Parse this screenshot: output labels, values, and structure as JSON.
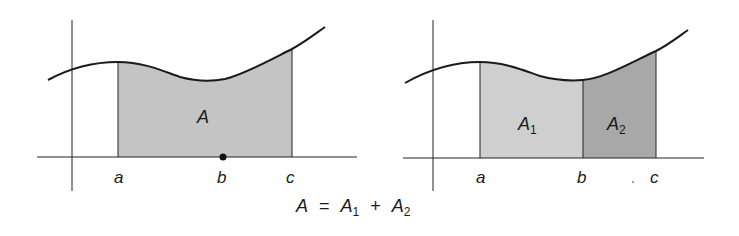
{
  "figure": {
    "left_panel": {
      "region_label": "A",
      "x_labels": [
        "a",
        "b",
        "c"
      ],
      "fill_color": "#c4c4c4",
      "marked_point": "b"
    },
    "right_panel": {
      "region1_label": "A",
      "region1_sub": "1",
      "region2_label": "A",
      "region2_sub": "2",
      "x_labels": [
        "a",
        "b",
        "c"
      ],
      "fill1_color": "#cfcfcf",
      "fill2_color": "#a8a8a8"
    },
    "equation": {
      "lhs": "A",
      "equals": "=",
      "term1": "A",
      "term1_sub": "1",
      "plus": "+",
      "term2": "A",
      "term2_sub": "2"
    }
  }
}
